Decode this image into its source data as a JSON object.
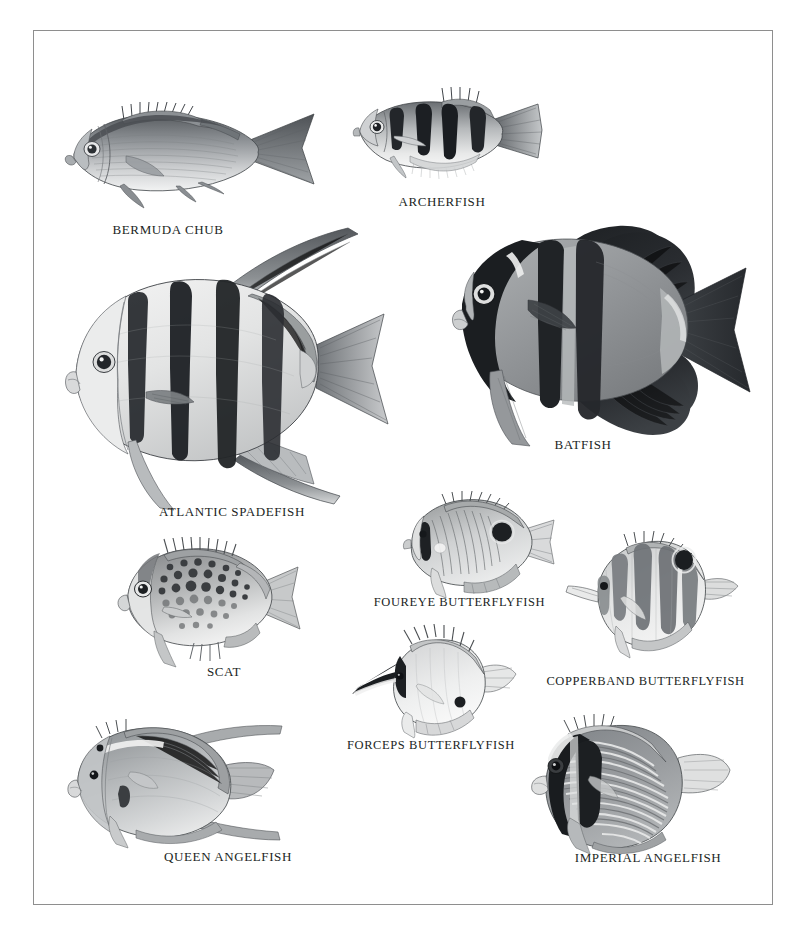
{
  "plate": {
    "title": "Fish identification plate",
    "subject": "Marine and freshwater fishes — chubs, archerfish, spadefish, batfish, scats, butterflyfishes and angelfishes",
    "style": "monochrome scientific illustration plate, thin gray rectangular border on white ground",
    "border_color": "#8e8e8e",
    "background_color": "#ffffff",
    "ink_color": "#211f1e"
  },
  "figures": [
    {
      "id": "bermuda-chub",
      "label": "BERMUDA CHUB",
      "position": "top-left",
      "description": "Oval silvery chub in left profile with spiny dorsal fin, forked tail, fine horizontal body striping",
      "body_tone": "#8e9296",
      "caption_x": 108,
      "caption_y": 222
    },
    {
      "id": "archerfish",
      "label": "ARCHERFISH",
      "position": "top-right of chub",
      "description": "Silvery fish in left profile with four bold black vertical wedge bars on the upper flank",
      "body_tone": "#b9bcbe",
      "caption_x": 394,
      "caption_y": 194
    },
    {
      "id": "atlantic-spadefish",
      "label": "ATLANTIC SPADEFISH",
      "position": "middle-left, large",
      "description": "Deep disc-shaped body with four broad black vertical bands, long trailing dorsal lobe, forked tail",
      "body_tone": "#d8d9da",
      "caption_x": 142,
      "caption_y": 504
    },
    {
      "id": "batfish",
      "label": "BATFISH",
      "position": "middle-right, large",
      "description": "Very tall dark-bodied batfish with sail-like dorsal and anal lobes and black vertical head bands",
      "body_tone": "#8a8d90",
      "caption_x": 548,
      "caption_y": 437
    },
    {
      "id": "scat",
      "label": "SCAT",
      "position": "lower-left cluster",
      "description": "Rounded spotted scat covered in dark round blotches, spiny dorsal, blunt head",
      "body_tone": "#b6b8b8",
      "caption_x": 202,
      "caption_y": 664
    },
    {
      "id": "foureye-butterflyfish",
      "label": "FOUREYE BUTTERFLYFISH",
      "position": "center",
      "description": "Disc-shaped butterflyfish with a large black eyespot near the tail and fine diagonal chevron lines",
      "body_tone": "#c9cbcc",
      "caption_x": 372,
      "caption_y": 595
    },
    {
      "id": "copperband-butterflyfish",
      "label": "COPPERBAND BUTTERFLYFISH",
      "position": "center-right",
      "description": "Long-snouted butterflyfish with four dark vertical bands and a black eyespot on the rear dorsal fin",
      "body_tone": "#d3d4d5",
      "caption_x": 543,
      "caption_y": 674
    },
    {
      "id": "forceps-butterflyfish",
      "label": "FORCEPS BUTTERFLYFISH",
      "position": "center-lower",
      "description": "Pale butterflyfish with a very long forceps-like snout, dark upper head and a small black anal spot",
      "body_tone": "#dcdddd",
      "caption_x": 347,
      "caption_y": 738
    },
    {
      "id": "queen-angelfish",
      "label": "QUEEN ANGELFISH",
      "position": "bottom-left",
      "description": "Smooth gray angelfish with long trailing dorsal and anal filaments and a rounded tail",
      "body_tone": "#aeb2b5",
      "caption_x": 158,
      "caption_y": 849
    },
    {
      "id": "imperial-angelfish",
      "label": "IMPERIAL ANGELFISH",
      "position": "bottom-right",
      "description": "Angelfish with many curved pale horizontal stripes and a dark black mask across the eye and chest",
      "body_tone": "#8d9093",
      "caption_x": 568,
      "caption_y": 850
    }
  ]
}
